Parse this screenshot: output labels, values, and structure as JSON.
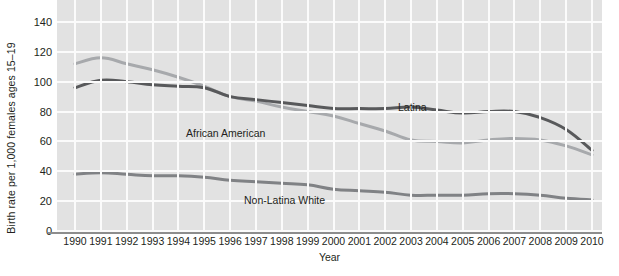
{
  "chart_data": {
    "type": "line",
    "title": "",
    "xlabel": "Year",
    "ylabel": "Birth rate per 1,000 females ages 15–19",
    "xlim": [
      1990,
      2010
    ],
    "ylim": [
      0,
      140
    ],
    "grid": true,
    "legend_position": "inline-annotations",
    "x": [
      1990,
      1991,
      1992,
      1993,
      1994,
      1995,
      1996,
      1997,
      1998,
      1999,
      2000,
      2001,
      2002,
      2003,
      2004,
      2005,
      2006,
      2007,
      2008,
      2009,
      2010
    ],
    "y_ticks": [
      0,
      20,
      40,
      60,
      80,
      100,
      120,
      140
    ],
    "x_ticks": [
      "1990",
      "1991",
      "1992",
      "1993",
      "1994",
      "1995",
      "1996",
      "1997",
      "1998",
      "1999",
      "2000",
      "2001",
      "2002",
      "2003",
      "2004",
      "2005",
      "2006",
      "2007",
      "2008",
      "2009",
      "2010"
    ],
    "series": [
      {
        "name": "Latina",
        "color": "#58595b",
        "values": [
          96,
          101,
          100,
          98,
          97,
          96,
          90,
          88,
          86,
          84,
          82,
          82,
          82,
          83,
          81,
          79,
          80,
          80,
          76,
          68,
          54
        ]
      },
      {
        "name": "African American",
        "color": "#a7a9ac",
        "values": [
          112,
          116,
          112,
          108,
          103,
          97,
          90,
          87,
          83,
          80,
          77,
          72,
          67,
          61,
          60,
          59,
          61,
          62,
          61,
          57,
          51
        ]
      },
      {
        "name": "Non-Latina White",
        "color": "#808285",
        "values": [
          38,
          39,
          38,
          37,
          37,
          36,
          34,
          33,
          32,
          31,
          28,
          27,
          26,
          24,
          24,
          24,
          25,
          25,
          24,
          22,
          21
        ]
      }
    ],
    "annotations": [
      {
        "text": "Latina",
        "x": 2006,
        "y": 88
      },
      {
        "text": "African American",
        "x": 1999,
        "y": 68
      },
      {
        "text": "Non-Latina White",
        "x": 2001,
        "y": 24
      }
    ]
  },
  "axes": {
    "y_title": "Birth rate per 1,000 females ages 15–19",
    "x_title": "Year"
  },
  "colors": {
    "plot_background": "#e2e2e2",
    "gridline": "#fbfbfb",
    "axis_line": "#8d8d8d",
    "text": "#231f20",
    "latina": "#58595b",
    "african_american": "#a7a9ac",
    "non_latina_white": "#808285"
  }
}
